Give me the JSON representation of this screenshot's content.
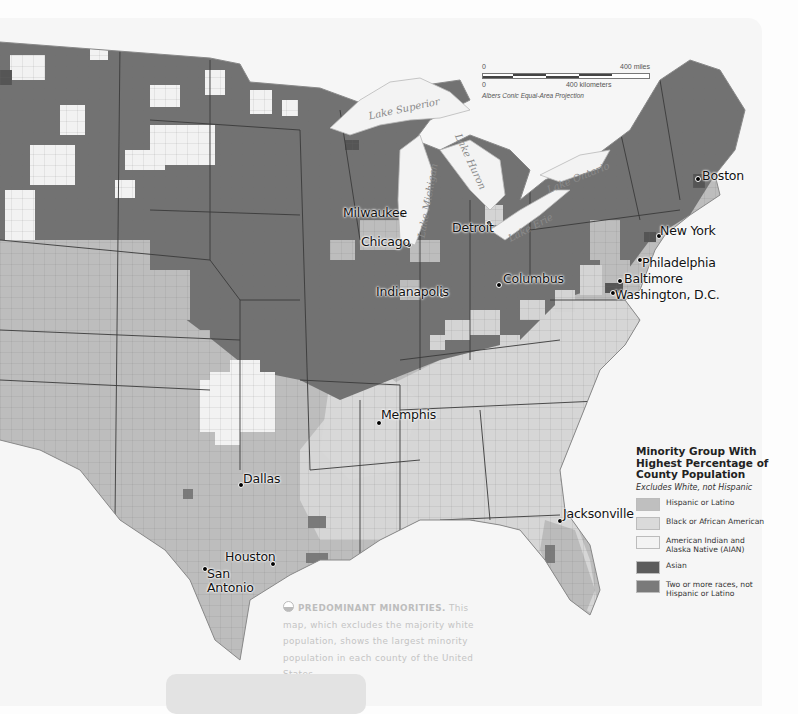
{
  "map": {
    "title": "Minority Group With Highest Percentage of County Population",
    "projection": "Albers Conic Equal-Area Projection",
    "scale": {
      "miles_start": "0",
      "miles_end": "400 miles",
      "km_start": "0",
      "km_end": "400 kilometers"
    },
    "lakes": [
      {
        "name": "Lake Superior"
      },
      {
        "name": "Lake Michigan"
      },
      {
        "name": "Lake Huron"
      },
      {
        "name": "Lake Ontario"
      },
      {
        "name": "Lake Erie"
      }
    ],
    "cities": [
      {
        "name": "Boston"
      },
      {
        "name": "Milwaukee"
      },
      {
        "name": "Detroit"
      },
      {
        "name": "Chicago"
      },
      {
        "name": "New York"
      },
      {
        "name": "Philadelphia"
      },
      {
        "name": "Columbus"
      },
      {
        "name": "Baltimore"
      },
      {
        "name": "Indianapolis"
      },
      {
        "name": "Washington, D.C."
      },
      {
        "name": "Memphis"
      },
      {
        "name": "Dallas"
      },
      {
        "name": "Jacksonville"
      },
      {
        "name": "Houston"
      },
      {
        "name": "San Antonio"
      }
    ]
  },
  "legend": {
    "title": "Minority Group With Highest Percentage of County Population",
    "subtitle": "Excludes White, not Hispanic",
    "items": [
      {
        "label": "Hispanic or Latino",
        "color": "#bfbfbf"
      },
      {
        "label": "Black or African American",
        "color": "#dadada"
      },
      {
        "label": "American Indian and Alaska Native (AIAN)",
        "color": "#f3f3f3"
      },
      {
        "label": "Asian",
        "color": "#5c5c5c"
      },
      {
        "label": "Two or more races, not Hispanic or Latino",
        "color": "#7a7a7a"
      }
    ]
  },
  "colors": {
    "hispanic": "#bfbfbf",
    "black": "#dadada",
    "aian": "#f3f3f3",
    "asian": "#5c5c5c",
    "two_or_more": "#7a7a7a",
    "water": "#f4f4f4"
  },
  "caption": {
    "heading": "PREDOMINANT MINORITIES.",
    "text": "This map, which excludes the majority white population, shows the largest minority population in each county of the United States."
  }
}
